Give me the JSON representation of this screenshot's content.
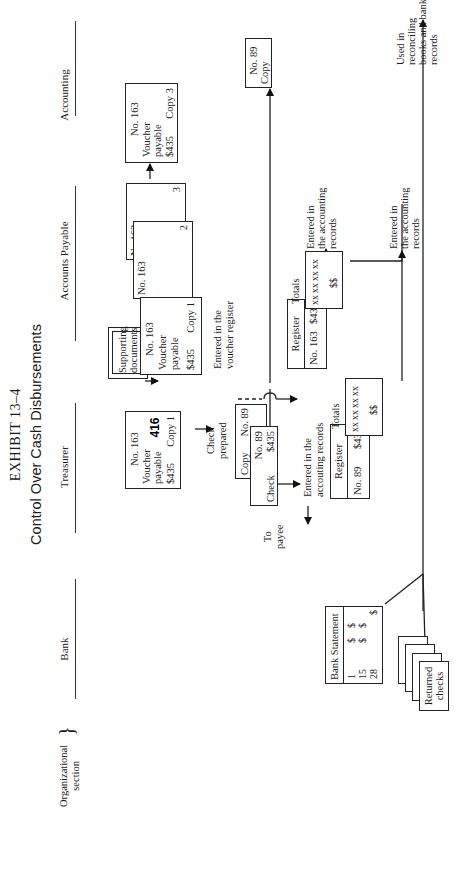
{
  "exhibit": {
    "label": "EXHIBIT 13–4",
    "title": "Control Over Cash Disbursements"
  },
  "page_number": "416",
  "org_section": {
    "label_line1": "Organizational",
    "label_line2": "section",
    "brace": "}"
  },
  "lanes": [
    {
      "label": "Bank"
    },
    {
      "label": "Treasurer"
    },
    {
      "label": "Accounts Payable"
    },
    {
      "label": "Accounting"
    },
    {
      "label": "Auditor"
    }
  ],
  "accounts_payable": {
    "supporting_docs_line1": "Supporting",
    "supporting_docs_line2": "documents",
    "voucher_copy1": {
      "no": "No. 163",
      "line1": "Voucher",
      "line2": "payable",
      "amount": "$435",
      "copy": "Copy 1"
    },
    "voucher_copy2": {
      "no": "No. 163",
      "copy": "2"
    },
    "voucher_copy3": {
      "no": "No.163",
      "copy": "3"
    },
    "entered_voucher_register_line1": "Entered in the",
    "entered_voucher_register_line2": "voucher register",
    "register": {
      "title": "Register",
      "no": "No. 163",
      "amount": "$435"
    },
    "totals": {
      "label": "Totals",
      "rows": [
        "xx",
        "xx",
        "xx",
        "xx"
      ],
      "total": "$$"
    }
  },
  "accounting": {
    "voucher_copy3": {
      "no": "No. 163",
      "line1": "Voucher",
      "line2": "payable",
      "amount": "$435",
      "copy": "Copy 3"
    },
    "check_copy": {
      "no": "No. 89",
      "label": "Copy"
    },
    "entered_records_1": {
      "line1": "Entered in",
      "line2": "the accounting",
      "line3": "records"
    },
    "entered_records_2": {
      "line1": "Entered in",
      "line2": "the accounting",
      "line3": "records"
    }
  },
  "treasurer": {
    "voucher_copy1": {
      "no": "No. 163",
      "line1": "Voucher",
      "line2": "payable",
      "amount": "$435",
      "copy": "Copy 1"
    },
    "check_prepared_line1": "Check",
    "check_prepared_line2": "prepared",
    "check_copy": {
      "label": "Copy",
      "no": "No. 89"
    },
    "check": {
      "label": "Check",
      "no": "No. 89",
      "amount": "$435"
    },
    "to_payee_line1": "To",
    "to_payee_line2": "payee",
    "entered_accounting_line1": "Entered in the",
    "entered_accounting_line2": "accouting records",
    "register": {
      "title": "Register",
      "no": "No. 89",
      "amount": "$435"
    },
    "totals": {
      "label": "Totals",
      "rows": [
        "xx",
        "xx",
        "xx",
        "xx"
      ],
      "total": "$$"
    }
  },
  "bank": {
    "statement": {
      "title": "Bank Statement",
      "rows": [
        {
          "day": "1",
          "c1": "$",
          "c2": "$"
        },
        {
          "day": "15",
          "c1": "$",
          "c2": "$"
        },
        {
          "day": "28",
          "c1": "",
          "c2": "$"
        }
      ]
    },
    "returned_checks_line1": "Returned",
    "returned_checks_line2": "checks"
  },
  "auditor": {
    "used_in_line1": "Used in",
    "used_in_line2": "reconciling",
    "used_in_line3": "books and bank",
    "used_in_line4": "records"
  }
}
